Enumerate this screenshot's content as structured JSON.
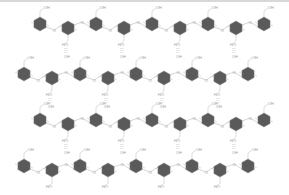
{
  "diagram": {
    "title": "",
    "colors": {
      "ring_fill": "#5a5a5a",
      "bond": "#b8b8b8",
      "label": "#999999",
      "hbond": "#aaaaaa",
      "top_border": "#d8d8d8"
    },
    "labels": {
      "hydroxyl_top": "OH",
      "hydroxyl_bottom": "HO",
      "oxygen": "O",
      "hydroxyl_side": "HO"
    },
    "rows": [
      {
        "y": 24,
        "x_start": 40,
        "count": 9,
        "spacing": 28
      },
      {
        "y": 74,
        "x_start": 24,
        "count": 9,
        "spacing": 28
      },
      {
        "y": 120,
        "x_start": 40,
        "count": 9,
        "spacing": 28
      },
      {
        "y": 166,
        "x_start": 24,
        "count": 9,
        "spacing": 28
      }
    ]
  }
}
